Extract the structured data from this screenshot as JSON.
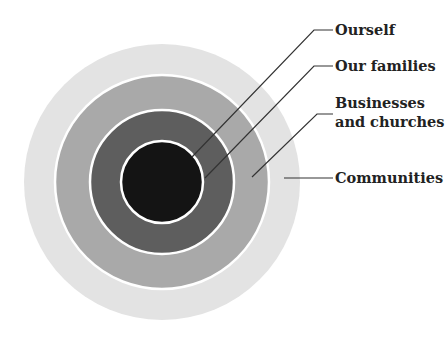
{
  "diagram": {
    "type": "concentric-circles",
    "rings": [
      {
        "level": 4,
        "name": "Communities",
        "color": "#e3e3e3"
      },
      {
        "level": 3,
        "name": "Businesses and churches",
        "color": "#a9a9a9"
      },
      {
        "level": 2,
        "name": "Our families",
        "color": "#5e5e5e"
      },
      {
        "level": 1,
        "name": "Ourself",
        "color": "#141414"
      }
    ],
    "labels": {
      "ourself": "Ourself",
      "families": "Our families",
      "businesses_line1": "Businesses",
      "businesses_line2": "and churches",
      "communities": "Communities"
    },
    "colors": {
      "separator": "#ffffff",
      "leader_line": "#333333",
      "label_text": "#222222"
    }
  }
}
